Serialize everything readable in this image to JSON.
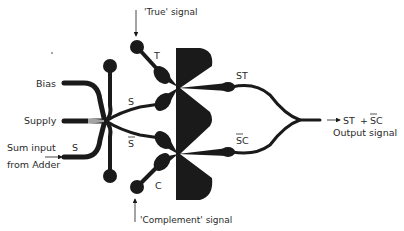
{
  "diagram": {
    "type": "fluidic logic element schematic",
    "labels": {
      "true_signal": "'True' signal",
      "complement_signal": "'Complement' signal",
      "bias": "Bias",
      "supply": "Supply",
      "sum_input_line1": "Sum input",
      "sum_input_line2": "from Adder",
      "sum_input_s": "S",
      "s_upper": "S",
      "s_bar": "S",
      "t": "T",
      "c": "C",
      "st": "ST",
      "sc_bar": "SC",
      "output_expr_st": "ST",
      "output_expr_plus": "+",
      "output_expr_sc": "SC",
      "output_signal": "Output signal"
    },
    "colors": {
      "ink": "#1a1a1a",
      "text": "#2a2a2a",
      "background": "#ffffff"
    }
  }
}
